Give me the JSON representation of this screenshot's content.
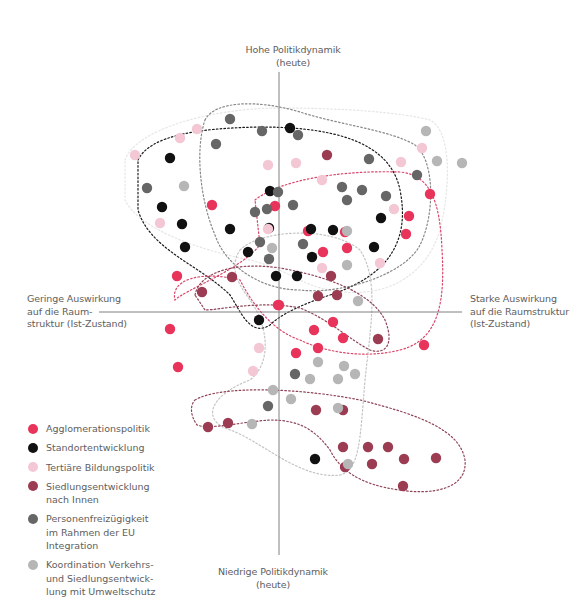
{
  "chart_data": {
    "type": "scatter",
    "title": "",
    "axes": {
      "top": "Hohe Politikdynamik\n(heute)",
      "bottom": "Niedrige Politikdynamik\n(heute)",
      "left": "Geringe Auswirkung\nauf die Raum-\nstruktur (Ist-Zustand)",
      "right": "Starke Auswirkung\nauf die Raumstruktur\n(Ist-Zustand)"
    },
    "xlabel": "Auswirkung auf die Raumstruktur (Ist-Zustand)",
    "ylabel": "Politikdynamik (heute)",
    "origin_px": [
      279,
      312
    ],
    "grid": false,
    "legend_position": "bottom-left",
    "series": [
      {
        "name": "Agglomerationspolitik",
        "color": "#e8335a",
        "points": [
          [
            212,
            205
          ],
          [
            275,
            206
          ],
          [
            170,
            329
          ],
          [
            178,
            367
          ],
          [
            279,
            305
          ],
          [
            308,
            231
          ],
          [
            323,
            252
          ],
          [
            347,
            248
          ],
          [
            345,
            232
          ],
          [
            430,
            194
          ],
          [
            409,
            216
          ],
          [
            406,
            234
          ],
          [
            333,
            322
          ],
          [
            314,
            330
          ],
          [
            343,
            338
          ],
          [
            296,
            353
          ],
          [
            318,
            348
          ],
          [
            424,
            345
          ],
          [
            278,
            305
          ],
          [
            177,
            276
          ]
        ]
      },
      {
        "name": "Standortentwicklung",
        "color": "#111111",
        "points": [
          [
            170,
            158
          ],
          [
            162,
            207
          ],
          [
            182,
            224
          ],
          [
            185,
            247
          ],
          [
            230,
            229
          ],
          [
            248,
            252
          ],
          [
            270,
            191
          ],
          [
            269,
            228
          ],
          [
            276,
            276
          ],
          [
            297,
            276
          ],
          [
            312,
            257
          ],
          [
            311,
            229
          ],
          [
            333,
            230
          ],
          [
            374,
            247
          ],
          [
            381,
            218
          ],
          [
            259,
            320
          ],
          [
            315,
            459
          ],
          [
            290,
            128
          ]
        ]
      },
      {
        "name": "Tertiäre Bildungspolitik",
        "color": "#f4c7d4",
        "points": [
          [
            135,
            155
          ],
          [
            180,
            138
          ],
          [
            197,
            129
          ],
          [
            160,
            223
          ],
          [
            268,
            165
          ],
          [
            296,
            163
          ],
          [
            268,
            229
          ],
          [
            322,
            180
          ],
          [
            322,
            268
          ],
          [
            394,
            209
          ],
          [
            380,
            263
          ],
          [
            422,
            148
          ],
          [
            401,
            162
          ],
          [
            259,
            348
          ],
          [
            253,
            371
          ]
        ]
      },
      {
        "name": "Siedlungsentwicklung nach Innen",
        "color": "#9c3c52",
        "points": [
          [
            327,
            155
          ],
          [
            202,
            292
          ],
          [
            232,
            277
          ],
          [
            331,
            276
          ],
          [
            318,
            296
          ],
          [
            337,
            295
          ],
          [
            378,
            339
          ],
          [
            316,
            410
          ],
          [
            343,
            410
          ],
          [
            208,
            427
          ],
          [
            228,
            423
          ],
          [
            343,
            447
          ],
          [
            368,
            447
          ],
          [
            388,
            447
          ],
          [
            345,
            467
          ],
          [
            372,
            464
          ],
          [
            404,
            459
          ],
          [
            436,
            458
          ],
          [
            403,
            486
          ]
        ]
      },
      {
        "name": "Personenfreizügigkeit im Rahmen der EU Integration",
        "color": "#666666",
        "points": [
          [
            230,
            119
          ],
          [
            262,
            131
          ],
          [
            298,
            135
          ],
          [
            216,
            144
          ],
          [
            147,
            188
          ],
          [
            369,
            159
          ],
          [
            417,
            175
          ],
          [
            386,
            196
          ],
          [
            342,
            187
          ],
          [
            362,
            190
          ],
          [
            293,
            205
          ],
          [
            255,
            212
          ],
          [
            267,
            209
          ],
          [
            260,
            242
          ],
          [
            269,
            259
          ],
          [
            303,
            244
          ],
          [
            347,
            200
          ],
          [
            278,
            192
          ],
          [
            295,
            374
          ],
          [
            268,
            406
          ]
        ]
      },
      {
        "name": "Koordination Verkehrs- und Siedlungsentwicklung mit Umweltschutz",
        "color": "#b6b6b6",
        "points": [
          [
            426,
            131
          ],
          [
            437,
            161
          ],
          [
            462,
            163
          ],
          [
            184,
            186
          ],
          [
            272,
            248
          ],
          [
            347,
            231
          ],
          [
            347,
            265
          ],
          [
            358,
            301
          ],
          [
            318,
            362
          ],
          [
            344,
            366
          ],
          [
            355,
            374
          ],
          [
            310,
            379
          ],
          [
            338,
            379
          ],
          [
            273,
            390
          ],
          [
            291,
            399
          ],
          [
            252,
            424
          ],
          [
            338,
            408
          ],
          [
            348,
            464
          ]
        ]
      }
    ],
    "clusters": [
      {
        "series": "Standortentwicklung",
        "color": "#1a1a1a"
      },
      {
        "series": "Agglomerationspolitik",
        "color": "#d9476a"
      },
      {
        "series": "Tertiäre Bildungspolitik",
        "color": "#eaeaea"
      },
      {
        "series": "Siedlungsentwicklung nach Innen",
        "color": "#8e4457"
      },
      {
        "series": "Personenfreizügigkeit im Rahmen der EU Integration",
        "color": "#777777"
      },
      {
        "series": "Koordination Verkehrs- und Siedlungsentwicklung mit Umweltschutz",
        "color": "#c4c4c4"
      }
    ]
  },
  "legend": [
    {
      "label": "Agglomerationspolitik",
      "color": "#e8335a"
    },
    {
      "label": "Standortentwicklung",
      "color": "#111111"
    },
    {
      "label": "Tertiäre Bildungspolitik",
      "color": "#f4c7d4"
    },
    {
      "label": "Siedlungsentwicklung\nnach Innen",
      "color": "#9c3c52"
    },
    {
      "label": "Personenfreizügigkeit\nim Rahmen der EU\nIntegration",
      "color": "#666666"
    },
    {
      "label": "Koordination Verkehrs-\nund Siedlungsentwick-\nlung mit Umweltschutz",
      "color": "#b6b6b6"
    }
  ]
}
